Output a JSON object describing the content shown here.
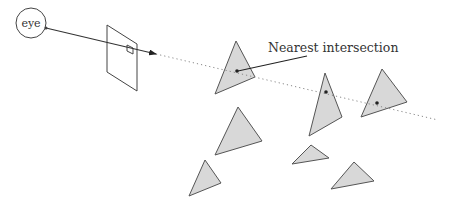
{
  "diagram": {
    "eye": {
      "label": "eye",
      "cx": 31,
      "cy": 23,
      "r": 15
    },
    "image_plane": {
      "points": "107,25 137,44 137,91 107,72",
      "pixel": "127,45 133,48 133,54 127,51"
    },
    "ray": {
      "solid": {
        "x1": 46,
        "y1": 28,
        "x2": 156,
        "y2": 54
      },
      "dotted": {
        "x1": 156,
        "y1": 54,
        "x2": 438,
        "y2": 120
      }
    },
    "annotation": {
      "label": "Nearest intersection",
      "x": 268,
      "y": 52,
      "pointer": {
        "x1": 238,
        "y1": 71,
        "x2": 307,
        "y2": 56
      }
    },
    "triangles": [
      {
        "id": "tri-1",
        "points": "236,41 215,94 255,77",
        "hit": true,
        "hit_x": 237,
        "hit_y": 71,
        "nearest": true
      },
      {
        "id": "tri-2",
        "points": "325,73 309,136 342,117",
        "hit": true,
        "hit_x": 326,
        "hit_y": 92,
        "nearest": false
      },
      {
        "id": "tri-3",
        "points": "382,69 361,117 407,102",
        "hit": true,
        "hit_x": 377,
        "hit_y": 103,
        "nearest": false
      },
      {
        "id": "tri-4",
        "points": "238,107 215,155 262,141",
        "hit": false
      },
      {
        "id": "tri-5",
        "points": "205,160 189,196 221,183",
        "hit": false
      },
      {
        "id": "tri-6",
        "points": "311,145 292,164 329,158",
        "hit": false
      },
      {
        "id": "tri-7",
        "points": "354,162 331,189 374,181",
        "hit": false
      }
    ],
    "colors": {
      "triangle_fill": "#d8d8d8",
      "stroke": "#555555",
      "background": "#ffffff"
    }
  }
}
